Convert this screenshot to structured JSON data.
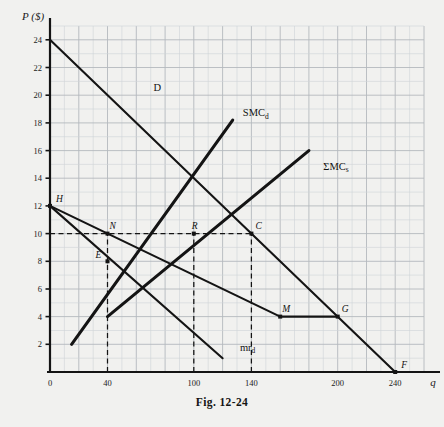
{
  "figure": {
    "caption": "Fig. 12-24",
    "axis_y_label": "P ($)",
    "axis_x_label": "q"
  },
  "chart_data": {
    "type": "line",
    "title": "Fig. 12-24",
    "xlabel": "q",
    "ylabel": "P ($)",
    "xlim": [
      0,
      260
    ],
    "ylim": [
      0,
      25
    ],
    "grid": true,
    "x_ticks": [
      0,
      40,
      100,
      140,
      200,
      240
    ],
    "y_ticks": [
      2,
      4,
      6,
      8,
      10,
      12,
      14,
      16,
      18,
      20,
      22,
      24
    ],
    "x_major_step": 20,
    "y_major_step": 2,
    "legend_position": "inline-labels",
    "series": [
      {
        "name": "D",
        "label": "D",
        "label_xy": [
          72,
          20.3
        ],
        "points": [
          [
            0,
            24
          ],
          [
            240,
            0
          ]
        ],
        "style": "solid"
      },
      {
        "name": "SMC_d",
        "label": "SMC",
        "label_sub": "d",
        "label_xy": [
          134,
          18.5
        ],
        "points": [
          [
            15,
            2
          ],
          [
            127,
            18.2
          ]
        ],
        "style": "solid"
      },
      {
        "name": "SumMC_s",
        "label": "ΣMC",
        "label_sub": "s",
        "label_xy": [
          190,
          14.6
        ],
        "points": [
          [
            40,
            4
          ],
          [
            180,
            16
          ]
        ],
        "style": "solid"
      },
      {
        "name": "mr_d",
        "label": "mr",
        "label_sub": "d",
        "label_xy": [
          132,
          1.55
        ],
        "points": [
          [
            0,
            12
          ],
          [
            120,
            1
          ]
        ],
        "style": "solid"
      },
      {
        "name": "HMG",
        "label": "",
        "points": [
          [
            0,
            12
          ],
          [
            160,
            4
          ],
          [
            200,
            4
          ]
        ],
        "style": "solid"
      }
    ],
    "annotations": [
      {
        "label": "H",
        "x": 0,
        "y": 12,
        "dx": 6,
        "dy": -4
      },
      {
        "label": "N",
        "x": 40,
        "y": 10,
        "dx": 2,
        "dy": -5
      },
      {
        "label": "E",
        "x": 40,
        "y": 8,
        "dx": -12,
        "dy": -3
      },
      {
        "label": "R",
        "x": 100,
        "y": 10,
        "dx": -2,
        "dy": -5
      },
      {
        "label": "C",
        "x": 140,
        "y": 10,
        "dx": 4,
        "dy": -5
      },
      {
        "label": "M",
        "x": 160,
        "y": 4,
        "dx": 2,
        "dy": -5
      },
      {
        "label": "G",
        "x": 200,
        "y": 4,
        "dx": 4,
        "dy": -5
      },
      {
        "label": "F",
        "x": 240,
        "y": 0,
        "dx": 6,
        "dy": -4
      }
    ],
    "dashed_guides": [
      {
        "name": "price-10-horizontal",
        "from": [
          0,
          10
        ],
        "to": [
          140,
          10
        ]
      },
      {
        "name": "q-40-vertical",
        "from": [
          40,
          0
        ],
        "to": [
          40,
          10
        ]
      },
      {
        "name": "q-100-vertical",
        "from": [
          100,
          0
        ],
        "to": [
          100,
          10
        ]
      },
      {
        "name": "q-140-vertical",
        "from": [
          140,
          0
        ],
        "to": [
          140,
          10
        ]
      }
    ]
  },
  "colors": {
    "background": "#f1f1ef",
    "ink": "#141414",
    "grid_minor": "#cfd3d6",
    "grid_major": "#b4b9bd"
  }
}
